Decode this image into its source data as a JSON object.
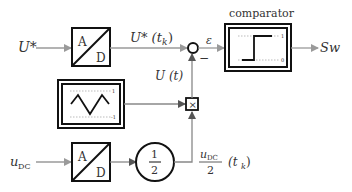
{
  "diagram": {
    "type": "block-diagram",
    "inputs": {
      "u_ref": {
        "label": "U*"
      },
      "u_dc": {
        "label_main": "u",
        "label_sub": "DC"
      }
    },
    "blocks": {
      "adc_top": {
        "a": "A",
        "d": "D"
      },
      "adc_bottom": {
        "a": "A",
        "d": "D"
      },
      "gain": {
        "num": "1",
        "den": "2"
      },
      "carrier": {
        "upper_tick": "1",
        "lower_tick": "-1"
      },
      "multiplier": {
        "symbol": "×"
      },
      "sum": {
        "sign": "−"
      },
      "comparator": {
        "title": "comparator",
        "high_tick": "1",
        "low_tick": "0"
      }
    },
    "signals": {
      "u_ref_sampled": "U* (t",
      "u_ref_sampled_sub": "k",
      "u_ref_sampled_close": ")",
      "carrier_scaled": "U (t)",
      "error": "ε",
      "half_dc_num_main": "u",
      "half_dc_num_sub": "DC",
      "half_dc_den": "2",
      "half_dc_arg": "(t",
      "half_dc_arg_sub": "k",
      "half_dc_arg_close": ")"
    },
    "output": {
      "label": "Sw"
    },
    "colors": {
      "line": "#9a9a9a",
      "block": "#111111",
      "text": "#333333"
    }
  }
}
